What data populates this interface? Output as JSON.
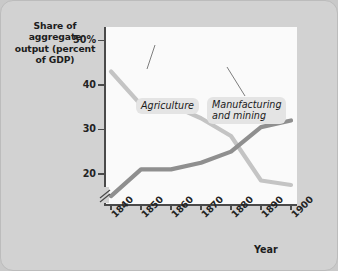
{
  "chart_data": {
    "type": "line",
    "title": "",
    "ylabel": "Share of aggregate output (percent of GDP)",
    "xlabel": "Year",
    "x": [
      1840,
      1850,
      1860,
      1870,
      1880,
      1890,
      1900
    ],
    "xtick_labels": [
      "1840",
      "1850",
      "1860",
      "1870",
      "1880",
      "1890",
      "1900"
    ],
    "ytick_labels": [
      "50%",
      "40",
      "30",
      "20"
    ],
    "ytick_values": [
      50,
      40,
      30,
      20
    ],
    "ylim": [
      13,
      53
    ],
    "xlim": [
      1838,
      1902
    ],
    "grid": false,
    "axis_break": true,
    "legend": "inline-annotations",
    "series": [
      {
        "name": "Agriculture",
        "color": "#c4c4c4",
        "values": [
          43,
          35.5,
          35.5,
          32.5,
          28.5,
          18.5,
          17.5
        ]
      },
      {
        "name": "Manufacturing and mining",
        "color": "#8f8f8f",
        "values": [
          15,
          21,
          21,
          22.5,
          25,
          30.5,
          32
        ]
      }
    ]
  },
  "axis": {
    "y_title_lines": [
      "Share of",
      "aggregate",
      "output (percent",
      "of GDP)"
    ],
    "y_title_text": "Share of aggregate output (percent of GDP)",
    "x_title": "Year"
  },
  "annotations": {
    "agriculture_label": "Agriculture",
    "manufacturing_label_line1": "Manufacturing",
    "manufacturing_label_line2": "and mining"
  },
  "colors": {
    "background": "#d2d2d2",
    "plot_background": "#fafafa",
    "agriculture_line": "#c4c4c4",
    "manufacturing_line": "#8f8f8f",
    "axis": "#4a4a4a",
    "text": "#1d1d1d",
    "label_box": "#e4e4e4"
  }
}
